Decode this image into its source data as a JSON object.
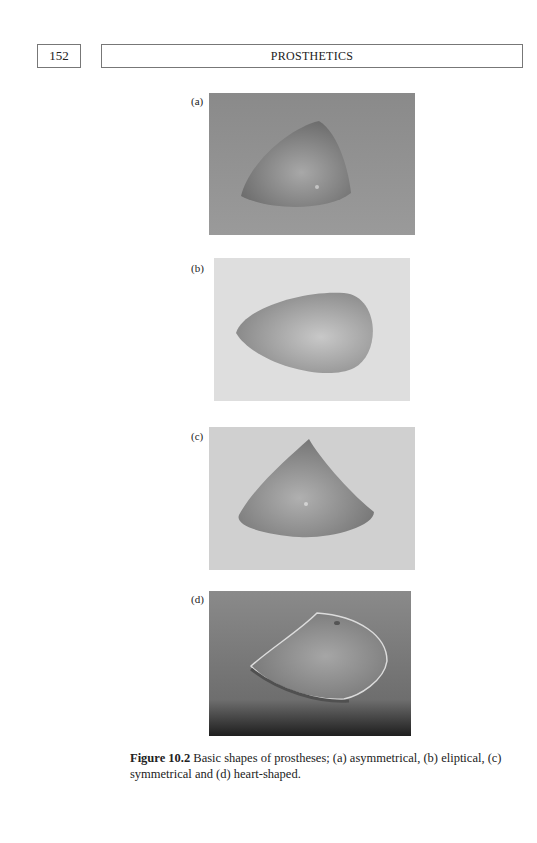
{
  "header": {
    "page_number": "152",
    "running_title": "PROSTHETICS"
  },
  "figure": {
    "panels": [
      {
        "label": "(a)",
        "shape": "asymmetrical",
        "background": "#8f8f8f"
      },
      {
        "label": "(b)",
        "shape": "eliptical",
        "background": "#dcdcdc"
      },
      {
        "label": "(c)",
        "shape": "symmetrical",
        "background": "#cfcfcf"
      },
      {
        "label": "(d)",
        "shape": "heart-shaped",
        "background": "#7a7a7a"
      }
    ],
    "caption": {
      "number": "Figure 10.2",
      "text": " Basic shapes of prostheses; (a) asymmetrical, (b) eliptical, (c) symmetrical and (d) heart-shaped."
    }
  }
}
